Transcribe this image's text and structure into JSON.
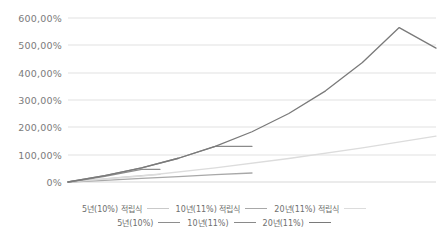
{
  "chart_data": {
    "type": "line",
    "title": "",
    "subtitle": "",
    "xlabel": "",
    "ylabel": "",
    "ylim": [
      0,
      600
    ],
    "yticks": [
      0,
      100,
      200,
      300,
      400,
      500,
      600
    ],
    "ytick_labels": [
      "0%",
      "100,00%",
      "200,00%",
      "300,00%",
      "400,00%",
      "500,00%",
      "600,00%"
    ],
    "xlim": [
      0,
      20
    ],
    "xticks": [],
    "xtick_labels": [],
    "grid": true,
    "legend_position": "bottom",
    "unit": "%",
    "series": [
      {
        "name": "5년(10%) 적립식",
        "color": "#c9c9c9",
        "x": [
          0,
          1,
          2,
          3,
          4,
          5
        ],
        "values": [
          0,
          5.5,
          11.5,
          17.5,
          23.0,
          28.0
        ]
      },
      {
        "name": "10년(11%) 적립식",
        "color": "#a8a8a8",
        "x": [
          0,
          2,
          4,
          6,
          8,
          10
        ],
        "values": [
          0,
          6.0,
          13.0,
          20.0,
          27.0,
          33.0
        ]
      },
      {
        "name": "20년(11%) 적립식",
        "color": "#dcdcdc",
        "x": [
          0,
          4,
          8,
          12,
          16,
          20
        ],
        "values": [
          0,
          22.0,
          52.0,
          86.0,
          125.0,
          168.0
        ]
      },
      {
        "name": "5년(10%)",
        "color": "#8e8e8e",
        "x": [
          0,
          1,
          2,
          3,
          4,
          5
        ],
        "values": [
          0,
          10.0,
          21.0,
          33.1,
          46.4,
          46.4
        ]
      },
      {
        "name": "10년(11%)",
        "color": "#8a8a8a",
        "x": [
          0,
          2,
          4,
          6,
          8,
          10
        ],
        "values": [
          0,
          23.2,
          51.8,
          86.9,
          130.5,
          130.5
        ]
      },
      {
        "name": "20년(11%)",
        "color": "#7a7a7a",
        "x": [
          0,
          2,
          4,
          6,
          8,
          10,
          12,
          14,
          16,
          18,
          20
        ],
        "values": [
          0,
          23.2,
          51.8,
          86.9,
          130.5,
          183.9,
          250.5,
          333.5,
          436.9,
          565.0,
          490.0
        ]
      }
    ]
  },
  "legend": {
    "rows": [
      [
        {
          "label": "5년(10%) 적립식",
          "color": "#c9c9c9"
        },
        {
          "label": "10년(11%) 적립식",
          "color": "#a8a8a8"
        },
        {
          "label": "20년(11%) 적립식",
          "color": "#dcdcdc"
        }
      ],
      [
        {
          "label": "5년(10%)",
          "color": "#8e8e8e"
        },
        {
          "label": "10년(11%)",
          "color": "#8a8a8a"
        },
        {
          "label": "20년(11%)",
          "color": "#7a7a7a"
        }
      ]
    ]
  },
  "style": {
    "background": "#ffffff",
    "gridline_color": "#e2e2e2",
    "axis_text_color": "#7b7b7b",
    "legend_text_color": "#6e6e6e"
  }
}
